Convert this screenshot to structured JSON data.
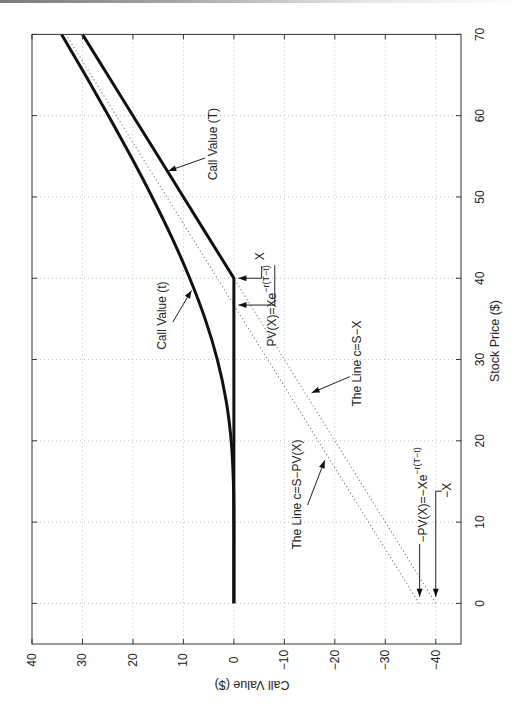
{
  "chart_data": {
    "type": "line",
    "title": "",
    "orientation": "figure rotated 90° counter-clockwise (stock price runs bottom→top, call value runs right→left)",
    "xlabel": "Stock Price ($)",
    "ylabel": "Call Value ($)",
    "xlim": [
      -5,
      70
    ],
    "ylim": [
      -45,
      40
    ],
    "grid": true,
    "xticks": [
      0,
      10,
      20,
      30,
      40,
      50,
      60,
      70
    ],
    "xtick_labels": [
      "0",
      "10",
      "20",
      "30",
      "40",
      "50",
      "60",
      "70"
    ],
    "yticks": [
      40,
      30,
      20,
      10,
      0,
      -10,
      -20,
      -30,
      -40
    ],
    "ytick_labels": [
      "40",
      "30",
      "20",
      "10",
      "0",
      "−10",
      "−20",
      "−30",
      "−40"
    ],
    "strike_X": 40,
    "pv_X": 36.7,
    "x": [
      0,
      5,
      10,
      15,
      20,
      25,
      30,
      35,
      40,
      45,
      50,
      55,
      60,
      65,
      70
    ],
    "series": [
      {
        "name": "Call Value (t)",
        "style": "thick",
        "smooth": true,
        "values": [
          0,
          0,
          0,
          0.1,
          0.53,
          1.55,
          3.28,
          5.7,
          8.75,
          12.28,
          16.21,
          20.42,
          24.85,
          29.43,
          34.13
        ]
      },
      {
        "name": "Call Value (T)",
        "style": "thick",
        "smooth": false,
        "values": [
          0,
          0,
          0,
          0,
          0,
          0,
          0,
          0,
          0,
          5,
          10,
          15,
          20,
          25,
          30
        ]
      },
      {
        "name": "The Line c=S−X",
        "style": "dotted",
        "smooth": false,
        "values": [
          -40,
          -35,
          -30,
          -25,
          -20,
          -15,
          -10,
          -5,
          0,
          5,
          10,
          15,
          20,
          25,
          30
        ]
      },
      {
        "name": "The Line c=S−PV(X)",
        "style": "dotted",
        "smooth": false,
        "values": [
          -36.7,
          -31.7,
          -26.7,
          -21.7,
          -16.7,
          -11.7,
          -6.7,
          -1.7,
          3.3,
          8.3,
          13.3,
          18.3,
          23.3,
          28.3,
          33.3
        ]
      }
    ],
    "annotations": [
      {
        "id": "call-value-T-label",
        "text": "Call Value (T)",
        "anchor": "middle",
        "pos": [
          56.5,
          4.2
        ],
        "arrow": [
          [
            54.8,
            5.7
          ],
          [
            53.2,
            13.0
          ]
        ],
        "head": true
      },
      {
        "id": "call-value-t-label",
        "text": "Call Value (t)",
        "anchor": "middle",
        "pos": [
          35.4,
          14.3
        ],
        "arrow": [
          [
            34.6,
            12.1
          ],
          [
            38.5,
            8.4
          ]
        ],
        "head": true
      },
      {
        "id": "strike-x-label",
        "text": "X",
        "anchor": "middle",
        "pos": [
          42.7,
          -5.2
        ],
        "arrow": [
          [
            41.5,
            -5.5
          ],
          [
            40.0,
            -5.5
          ],
          [
            40.0,
            -0.9
          ]
        ],
        "head": true
      },
      {
        "id": "pv-x-label",
        "text": "PV(X)=Xe",
        "sup": "−r(T−t)",
        "anchor": "start",
        "pos": [
          31.6,
          -7.5
        ],
        "arrow": [
          [
            41.6,
            -8.1
          ],
          [
            36.7,
            -8.1
          ],
          [
            36.7,
            -0.9
          ]
        ],
        "head": true
      },
      {
        "id": "line-s-minus-x-label",
        "text": "The Line c=S−X",
        "anchor": "middle",
        "pos": [
          29.5,
          -24.4
        ],
        "arrow": [
          [
            27.9,
            -23.0
          ],
          [
            25.9,
            -15.4
          ]
        ],
        "head": true
      },
      {
        "id": "line-s-minus-pv-label",
        "text": "The Line c=S−PV(X)",
        "anchor": "middle",
        "pos": [
          13.4,
          -12.5
        ],
        "arrow": [
          [
            12.1,
            -14.6
          ],
          [
            17.6,
            -18.0
          ]
        ],
        "head": true
      },
      {
        "id": "neg-pv-x-label",
        "text": "−PV(X)=−Xe",
        "sup": "−r(T−t)",
        "anchor": "start",
        "pos": [
          7.5,
          -37.4
        ],
        "arrow": [
          [
            7.3,
            -36.8
          ],
          [
            0.8,
            -36.8
          ]
        ],
        "head": true
      },
      {
        "id": "neg-x-label",
        "text": "−X",
        "anchor": "middle",
        "pos": [
          13.9,
          -42.2
        ],
        "arrow": [
          [
            13.8,
            -41.2
          ],
          [
            13.8,
            -40.0
          ],
          [
            0.8,
            -40.0
          ]
        ],
        "head": true
      }
    ]
  }
}
